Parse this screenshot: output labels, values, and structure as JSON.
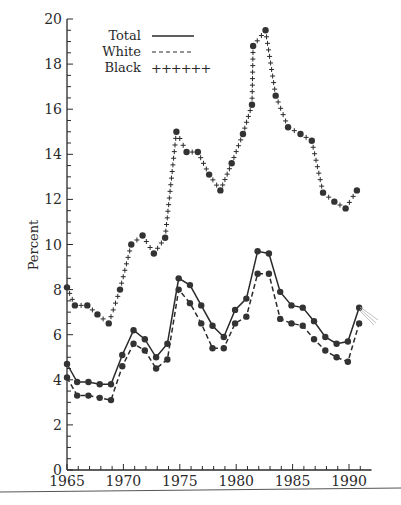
{
  "chart_data": {
    "type": "line",
    "title": "",
    "xlabel": "",
    "ylabel": "Percent",
    "xlim": [
      1965,
      1992
    ],
    "ylim": [
      0,
      20
    ],
    "x_ticks": [
      1965,
      1970,
      1975,
      1980,
      1985,
      1990
    ],
    "x_tick_labels": [
      "1965",
      "1970",
      "1975",
      "1980",
      "1985",
      "1990"
    ],
    "y_ticks": [
      0,
      2,
      4,
      6,
      8,
      10,
      12,
      14,
      16,
      18,
      20
    ],
    "y_tick_labels": [
      "0",
      "2",
      "4",
      "6",
      "8",
      "10",
      "12",
      "14",
      "16",
      "18",
      "20"
    ],
    "grid": false,
    "legend": {
      "placement": "top-left",
      "entries": [
        {
          "label": "Total",
          "style": "solid",
          "sample": ""
        },
        {
          "label": "White",
          "style": "dashed",
          "sample": ""
        },
        {
          "label": "Black",
          "style": "plus",
          "sample": "++++++"
        }
      ]
    },
    "series": [
      {
        "name": "Total",
        "style": "solid",
        "x": [
          1965,
          1965.9,
          1966.9,
          1967.9,
          1968.9,
          1969.9,
          1970.9,
          1971.9,
          1972.9,
          1973.9,
          1974.9,
          1975.9,
          1976.9,
          1977.9,
          1978.9,
          1979.9,
          1980.9,
          1981.9,
          1982.9,
          1983.9,
          1984.9,
          1985.9,
          1986.9,
          1987.9,
          1988.9,
          1989.9,
          1990.9
        ],
        "values": [
          4.7,
          3.9,
          3.9,
          3.8,
          3.8,
          5.1,
          6.2,
          5.8,
          5.0,
          5.6,
          8.5,
          8.2,
          7.3,
          6.4,
          5.9,
          7.1,
          7.6,
          9.7,
          9.6,
          7.9,
          7.3,
          7.2,
          6.6,
          5.9,
          5.6,
          5.7,
          7.2
        ]
      },
      {
        "name": "White",
        "style": "dashed",
        "x": [
          1965,
          1965.9,
          1966.9,
          1967.9,
          1968.9,
          1969.9,
          1970.9,
          1971.9,
          1972.9,
          1973.9,
          1974.9,
          1975.9,
          1976.9,
          1977.9,
          1978.9,
          1979.9,
          1980.9,
          1981.9,
          1982.9,
          1983.9,
          1984.9,
          1985.9,
          1986.9,
          1987.9,
          1988.9,
          1989.9,
          1990.9
        ],
        "values": [
          4.1,
          3.3,
          3.3,
          3.2,
          3.1,
          4.6,
          5.6,
          5.3,
          4.5,
          4.9,
          8.0,
          7.4,
          6.5,
          5.4,
          5.4,
          6.5,
          6.8,
          8.7,
          8.7,
          6.7,
          6.5,
          6.4,
          5.8,
          5.3,
          5.0,
          4.8,
          6.5
        ]
      },
      {
        "name": "Black",
        "style": "plus",
        "x": [
          1965,
          1965.7,
          1966.8,
          1967.7,
          1968.7,
          1969.7,
          1970.7,
          1971.7,
          1972.7,
          1973.7,
          1974.7,
          1975.6,
          1976.6,
          1977.6,
          1978.6,
          1979.6,
          1980.6,
          1981.4,
          1981.5,
          1982.6,
          1983.5,
          1984.6,
          1985.7,
          1986.7,
          1987.7,
          1988.7,
          1989.7,
          1990.7
        ],
        "values": [
          8.1,
          7.3,
          7.3,
          6.9,
          6.5,
          8.0,
          10.0,
          10.4,
          9.6,
          10.3,
          15.0,
          14.1,
          14.1,
          13.1,
          12.4,
          13.6,
          14.9,
          16.2,
          18.8,
          19.5,
          16.6,
          15.2,
          14.9,
          14.6,
          12.3,
          11.9,
          11.6,
          12.4
        ]
      }
    ]
  }
}
